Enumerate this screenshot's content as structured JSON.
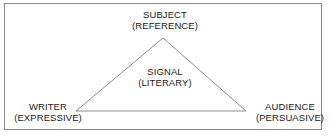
{
  "diagram": {
    "frame": {
      "border_color": "#8a8a8a",
      "background_color": "#ffffff"
    },
    "triangle": {
      "line_color": "#8e8e8e",
      "apex": {
        "x": 163,
        "y": 38
      },
      "bottom_left": {
        "x": 76,
        "y": 111
      },
      "bottom_right": {
        "x": 246,
        "y": 111
      }
    },
    "labels": {
      "subject": {
        "line1": "SUBJECT",
        "line2": "(REFERENCE)"
      },
      "signal": {
        "line1": "SIGNAL",
        "line2": "(LITERARY)"
      },
      "writer": {
        "line1": "WRITER",
        "line2": "(EXPRESSIVE)"
      },
      "audience": {
        "line1": "AUDIENCE",
        "line2": "(PERSUASIVE)"
      }
    },
    "text_color": "#1b1b1b"
  }
}
